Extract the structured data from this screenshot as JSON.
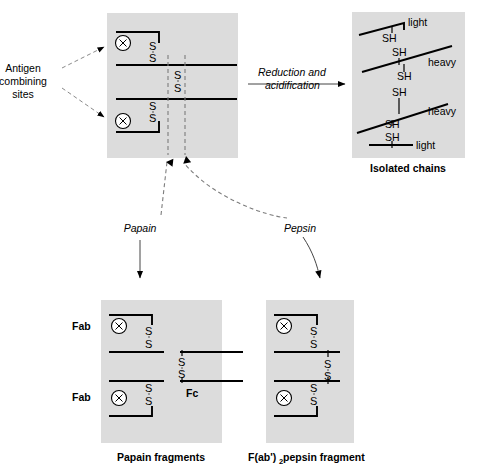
{
  "figure": {
    "panel_fill": "#dcdcdc",
    "line_color": "#000000"
  },
  "labels": {
    "antigen_sites": {
      "line1": "Antigen",
      "line2": "combining",
      "line3": "sites"
    },
    "reduction": {
      "line1": "Reduction and",
      "line2": "acidification"
    },
    "papain": "Papain",
    "pepsin": "Pepsin",
    "isolated_chains_caption": "Isolated chains",
    "papain_caption": "Papain fragments",
    "pepsin_caption_main": "F(ab')",
    "pepsin_caption_sub": "2",
    "pepsin_caption_tail": " pepsin fragment",
    "fab_upper": "Fab",
    "fab_lower": "Fab",
    "fc": "Fc",
    "sulfur": "S",
    "thiol": "SH",
    "light": "light",
    "heavy": "heavy"
  },
  "intact_antibody": {
    "panel": {
      "x": 107,
      "y": 13,
      "w": 131,
      "h": 145
    },
    "disulfides": [
      {
        "group": "upper-light-heavy",
        "s_top_y": 46,
        "s_bottom_y": 60,
        "x": 153
      },
      {
        "group": "hinge",
        "s_top_y": 75,
        "s_bottom_y": 89,
        "x": 178
      },
      {
        "group": "lower-light-heavy",
        "s_top_y": 106,
        "s_bottom_y": 120,
        "x": 153
      }
    ],
    "antigen_site_markers": 2,
    "cut_lines": [
      {
        "name": "papain-cut",
        "x": 168
      },
      {
        "name": "pepsin-cut",
        "x": 185
      }
    ]
  },
  "isolated_chains": {
    "panel": {
      "x": 352,
      "y": 12,
      "w": 113,
      "h": 146
    },
    "chains": [
      {
        "name": "light",
        "label": "light",
        "thiols": 1
      },
      {
        "name": "heavy",
        "label": "heavy",
        "thiols": 3
      },
      {
        "name": "heavy",
        "label": "heavy",
        "thiols": 3
      },
      {
        "name": "light",
        "label": "light",
        "thiols": 1
      }
    ],
    "thiol_count": 8
  },
  "papain_fragments": {
    "panel": {
      "x": 101,
      "y": 300,
      "w": 121,
      "h": 143
    },
    "fragments": [
      {
        "name": "Fab",
        "antigen_site": true,
        "disulfide_pairs": 1
      },
      {
        "name": "Fab",
        "antigen_site": true,
        "disulfide_pairs": 1
      },
      {
        "name": "Fc",
        "antigen_site": false,
        "disulfide_pairs": 1
      }
    ]
  },
  "pepsin_fragment": {
    "panel": {
      "x": 266,
      "y": 300,
      "w": 88,
      "h": 143
    },
    "fragment": {
      "name": "F(ab')2",
      "antigen_sites": 2,
      "disulfide_pairs": 3
    }
  },
  "arrows": [
    {
      "name": "reduction-arrow",
      "from": "intact-antibody",
      "to": "isolated-chains",
      "style": "solid"
    },
    {
      "name": "papain-arrow",
      "from": "intact-antibody",
      "to": "papain-fragments",
      "style": "dashed-then-solid"
    },
    {
      "name": "pepsin-arrow",
      "from": "intact-antibody",
      "to": "pepsin-fragment",
      "style": "dashed-then-solid"
    }
  ]
}
